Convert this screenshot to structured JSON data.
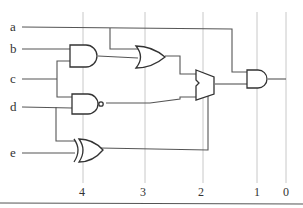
{
  "inputs": [
    {
      "name": "a",
      "y": 28
    },
    {
      "name": "b",
      "y": 50
    },
    {
      "name": "c",
      "y": 79
    },
    {
      "name": "d",
      "y": 107
    },
    {
      "name": "e",
      "y": 152
    }
  ],
  "columns": [
    {
      "label": "4",
      "x": 83
    },
    {
      "label": "3",
      "x": 145
    },
    {
      "label": "2",
      "x": 203
    },
    {
      "label": "1",
      "x": 257
    },
    {
      "label": "0",
      "x": 286
    }
  ],
  "gates": [
    {
      "id": "and1",
      "type": "AND",
      "inputs": [
        "b",
        "c"
      ],
      "column": "4"
    },
    {
      "id": "nand1",
      "type": "NAND",
      "inputs": [
        "c",
        "d"
      ],
      "column": "4"
    },
    {
      "id": "xor1",
      "type": "XOR",
      "inputs": [
        "d",
        "e"
      ],
      "column": "4"
    },
    {
      "id": "or1",
      "type": "OR",
      "inputs": [
        "a",
        "and1"
      ],
      "column": "3"
    },
    {
      "id": "mux1",
      "type": "MUX",
      "inputs": [
        "or1",
        "nand1"
      ],
      "select": "xor1",
      "column": "2"
    },
    {
      "id": "and2",
      "type": "AND",
      "inputs": [
        "a",
        "mux1"
      ],
      "column": "1"
    }
  ],
  "colors": {
    "wire": "#555555",
    "gate": "#333333",
    "grid": "#c8c8c8",
    "text": "#333333"
  }
}
